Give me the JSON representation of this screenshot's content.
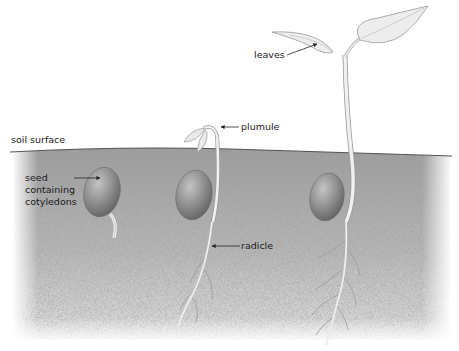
{
  "diagram": {
    "type": "biological-illustration",
    "colors": {
      "soil": "#a6a6a6",
      "soil_light": "#d4d4d4",
      "surface_line": "#555555",
      "seed": "#8a8a8a",
      "plant": "#e8e8e8",
      "plant_outline": "#9a9a9a",
      "label_text": "#1a1a1a",
      "pointer": "#222222"
    },
    "labels": {
      "soil_surface": "soil surface",
      "seed_line1": "seed",
      "seed_line2": "containing",
      "seed_line3": "cotyledons",
      "plumule": "plumule",
      "radicle": "radicle",
      "leaves": "leaves"
    },
    "stages": [
      {
        "name": "seed with emerging root"
      },
      {
        "name": "seedling with plumule and radicle"
      },
      {
        "name": "young plant with leaves"
      }
    ]
  }
}
